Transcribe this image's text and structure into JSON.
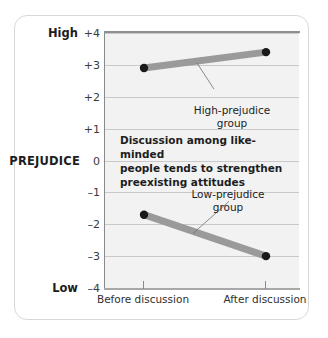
{
  "chart_data": {
    "type": "line",
    "title": "",
    "xlabel": "",
    "ylabel": "PREJUDICE",
    "categories": [
      "Before discussion",
      "After discussion"
    ],
    "ylim": [
      -4,
      4
    ],
    "grid": true,
    "legend_position": "inline-annotations",
    "ytick_labels": [
      "+4",
      "+3",
      "+2",
      "+1",
      "0",
      "–1",
      "–2",
      "–3",
      "–4"
    ],
    "ytick_values": [
      4,
      3,
      2,
      1,
      0,
      -1,
      -2,
      -3,
      -4
    ],
    "axis_end_labels": {
      "high": "High",
      "low": "Low"
    },
    "series": [
      {
        "name": "High-prejudice group",
        "values": [
          2.9,
          3.4
        ]
      },
      {
        "name": "Low-prejudice group",
        "values": [
          -1.7,
          -3.0
        ]
      }
    ],
    "annotations": [
      {
        "name": "high-prejudice-label",
        "text": "High-prejudice\ngroup"
      },
      {
        "name": "low-prejudice-label",
        "text": "Low-prejudice\ngroup"
      },
      {
        "name": "caption",
        "text": "Discussion among like-minded\npeople tends to strengthen\npreexisting attitudes"
      }
    ],
    "colors": {
      "series_band": "#9a9a9a",
      "endpoint_dot": "#1a1a1a",
      "gridline": "#c9c9c9",
      "plot_background": "#f2f2f2",
      "axis": "#8a8a8a",
      "card_border": "#d8d8d8",
      "text": "#1d1d1d"
    }
  }
}
